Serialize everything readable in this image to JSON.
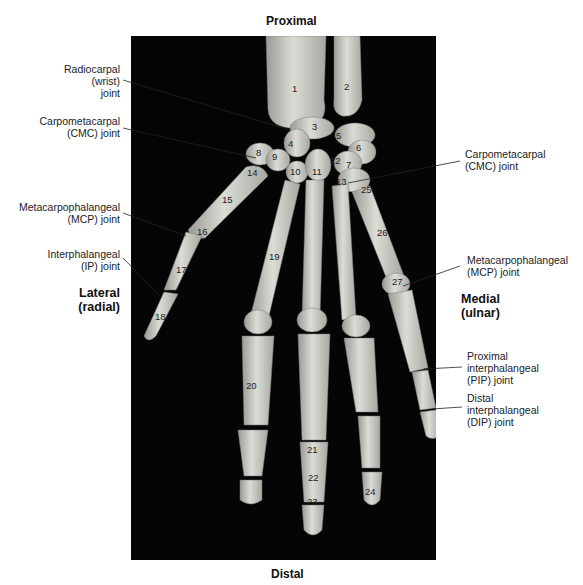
{
  "orientation": {
    "top": "Proximal",
    "bottom": "Distal",
    "left": [
      "Lateral",
      "(radial)"
    ],
    "right": [
      "Medial",
      "(ulnar)"
    ]
  },
  "left_labels": [
    {
      "lines": [
        "Radiocarpal",
        "(wrist)",
        "joint"
      ]
    },
    {
      "lines": [
        "Carpometacarpal",
        "(CMC) joint"
      ]
    },
    {
      "lines": [
        "Metacarpophalangeal",
        "(MCP) joint"
      ]
    },
    {
      "lines": [
        "Interphalangeal",
        "(IP) joint"
      ]
    }
  ],
  "right_labels": [
    {
      "lines": [
        "Carpometacarpal",
        "(CMC) joint"
      ]
    },
    {
      "lines": [
        "Metacarpophalangeal",
        "(MCP) joint"
      ]
    },
    {
      "lines": [
        "Proximal",
        "interphalangeal",
        "(PIP) joint"
      ]
    },
    {
      "lines": [
        "Distal",
        "interphalangeal",
        "(DIP) joint"
      ]
    }
  ],
  "bone_numbers": [
    "1",
    "2",
    "3",
    "4",
    "5",
    "6",
    "7",
    "8",
    "9",
    "10",
    "11",
    "12",
    "13",
    "14",
    "15",
    "16",
    "17",
    "18",
    "19",
    "20",
    "21",
    "22",
    "23",
    "24",
    "25",
    "26",
    "27"
  ]
}
